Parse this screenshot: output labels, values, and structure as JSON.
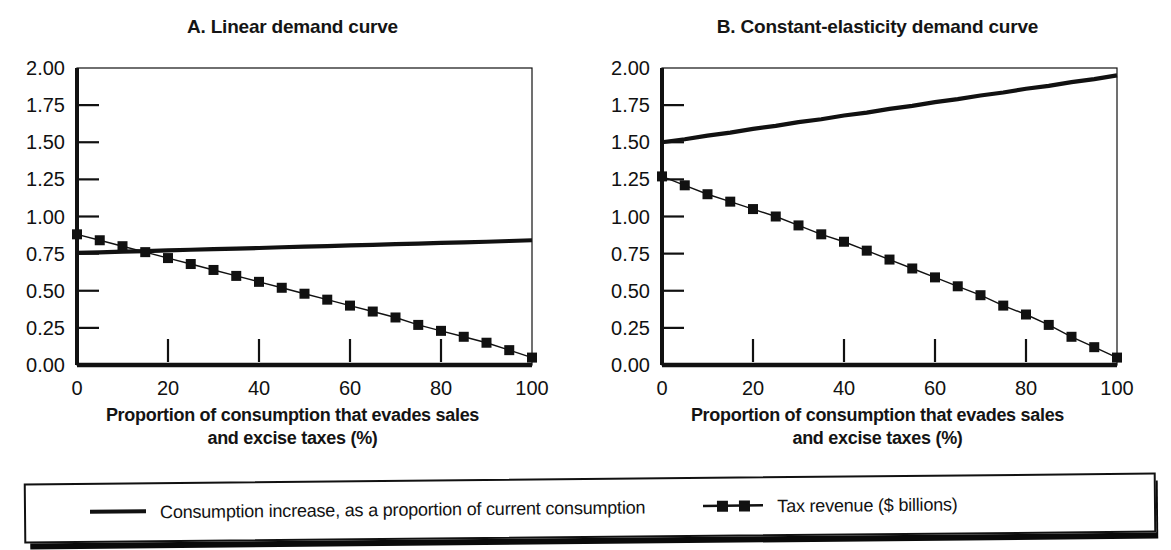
{
  "figure": {
    "background": "#ffffff",
    "ink_color": "#111111"
  },
  "legend": {
    "name": "chart-legend",
    "items": [
      {
        "label": "Consumption increase, as a proportion of current consumption",
        "marker": "solid-line",
        "icon_name": "legend-line-icon"
      },
      {
        "label": "Tax revenue ($ billions)",
        "marker": "line-with-square-markers",
        "icon_name": "legend-line-square-icon"
      }
    ]
  },
  "panels": [
    {
      "id": "panel-a",
      "title": "A. Linear demand curve",
      "xlabel_line1": "Proportion of consumption that evades sales",
      "xlabel_line2": "and excise taxes (%)"
    },
    {
      "id": "panel-b",
      "title": "B. Constant-elasticity demand curve",
      "xlabel_line1": "Proportion of consumption that evades sales",
      "xlabel_line2": "and excise taxes (%)"
    }
  ],
  "chart_data": [
    {
      "type": "line",
      "panel": "A",
      "title": "A. Linear demand curve",
      "xlabel": "Proportion of consumption that evades sales and excise taxes (%)",
      "ylabel": "",
      "xlim": [
        0,
        100
      ],
      "ylim": [
        0,
        2.0
      ],
      "xticks": [
        0,
        20,
        40,
        60,
        80,
        100
      ],
      "xticklabels": [
        "0",
        "20",
        "40",
        "60",
        "80",
        "100"
      ],
      "yticks": [
        0.0,
        0.25,
        0.5,
        0.75,
        1.0,
        1.25,
        1.5,
        1.75,
        2.0
      ],
      "yticklabels": [
        "0.00",
        "0.25",
        "0.50",
        "0.75",
        "1.00",
        "1.25",
        "1.50",
        "1.75",
        "2.00"
      ],
      "grid": false,
      "legend_position": "below-figure",
      "x": [
        0,
        5,
        10,
        15,
        20,
        25,
        30,
        35,
        40,
        45,
        50,
        55,
        60,
        65,
        70,
        75,
        80,
        85,
        90,
        95,
        100
      ],
      "series": [
        {
          "name": "Consumption increase, as a proportion of current consumption",
          "style": "thick-solid",
          "values": [
            0.755,
            0.759,
            0.763,
            0.767,
            0.772,
            0.776,
            0.78,
            0.784,
            0.788,
            0.793,
            0.797,
            0.801,
            0.805,
            0.809,
            0.814,
            0.818,
            0.822,
            0.826,
            0.83,
            0.835,
            0.84
          ]
        },
        {
          "name": "Tax revenue ($ billions)",
          "style": "thin-solid-with-square-markers",
          "values": [
            0.88,
            0.84,
            0.8,
            0.76,
            0.72,
            0.68,
            0.64,
            0.6,
            0.56,
            0.52,
            0.48,
            0.44,
            0.4,
            0.36,
            0.32,
            0.27,
            0.23,
            0.19,
            0.15,
            0.1,
            0.05
          ]
        }
      ]
    },
    {
      "type": "line",
      "panel": "B",
      "title": "B. Constant-elasticity demand curve",
      "xlabel": "Proportion of consumption that evades sales and excise taxes (%)",
      "ylabel": "",
      "xlim": [
        0,
        100
      ],
      "ylim": [
        0,
        2.0
      ],
      "xticks": [
        0,
        20,
        40,
        60,
        80,
        100
      ],
      "xticklabels": [
        "0",
        "20",
        "40",
        "60",
        "80",
        "100"
      ],
      "yticks": [
        0.0,
        0.25,
        0.5,
        0.75,
        1.0,
        1.25,
        1.5,
        1.75,
        2.0
      ],
      "yticklabels": [
        "0.00",
        "0.25",
        "0.50",
        "0.75",
        "1.00",
        "1.25",
        "1.50",
        "1.75",
        "2.00"
      ],
      "grid": false,
      "legend_position": "below-figure",
      "x": [
        0,
        5,
        10,
        15,
        20,
        25,
        30,
        35,
        40,
        45,
        50,
        55,
        60,
        65,
        70,
        75,
        80,
        85,
        90,
        95,
        100
      ],
      "series": [
        {
          "name": "Consumption increase, as a proportion of current consumption",
          "style": "thick-solid",
          "values": [
            1.5,
            1.52,
            1.545,
            1.565,
            1.59,
            1.61,
            1.635,
            1.655,
            1.68,
            1.7,
            1.725,
            1.745,
            1.77,
            1.79,
            1.815,
            1.835,
            1.86,
            1.88,
            1.905,
            1.925,
            1.95
          ]
        },
        {
          "name": "Tax revenue ($ billions)",
          "style": "thin-solid-with-square-markers",
          "values": [
            1.27,
            1.21,
            1.15,
            1.1,
            1.05,
            1.0,
            0.94,
            0.88,
            0.83,
            0.77,
            0.71,
            0.65,
            0.59,
            0.53,
            0.47,
            0.4,
            0.34,
            0.27,
            0.19,
            0.12,
            0.05
          ]
        }
      ]
    }
  ]
}
